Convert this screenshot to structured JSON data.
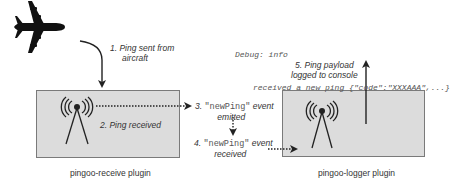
{
  "diagram": {
    "step1": {
      "line1": "1. Ping sent from",
      "line2": "aircraft"
    },
    "step2": "2. Ping received",
    "step3": {
      "prefix": "3.",
      "event": "\"newPing\"",
      "suffix": "event",
      "line2": "emitted"
    },
    "step4": {
      "prefix": "4.",
      "event": "\"newPing\"",
      "suffix": "event",
      "line2": "received"
    },
    "step5": {
      "line1": "5. Ping payload",
      "line2": "logged to console"
    },
    "console": {
      "line1": "Debug: info",
      "line2": "received a new ping {\"code\":\"XXXAAA\",...}"
    },
    "plugins": [
      {
        "name": "pingoo-receive plugin"
      },
      {
        "name": "pingoo-logger plugin"
      }
    ],
    "icons": [
      "airplane-icon",
      "antenna-icon"
    ],
    "colors": {
      "box_fill": "#dcdcdc",
      "box_border": "#7a7a7a",
      "arrow": "#222222"
    }
  }
}
